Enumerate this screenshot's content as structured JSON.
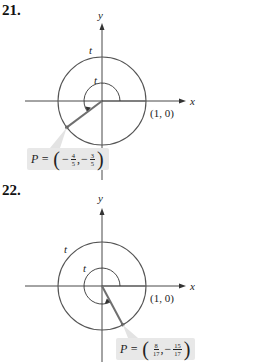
{
  "problems": [
    {
      "number": "21.",
      "axis_labels": {
        "x": "x",
        "y": "y"
      },
      "arc_label_outer": "t",
      "arc_label_inner": "t",
      "point_label": "(1, 0)",
      "P": {
        "prefix": "P =",
        "x": {
          "sign": "−",
          "num": "4",
          "den": "5"
        },
        "y": {
          "sign": "−",
          "num": "3",
          "den": "5"
        }
      }
    },
    {
      "number": "22.",
      "axis_labels": {
        "x": "x",
        "y": "y"
      },
      "arc_label_outer": "t",
      "arc_label_inner": "t",
      "point_label": "(1, 0)",
      "P": {
        "prefix": "P =",
        "x": {
          "sign": "",
          "num": "8",
          "den": "17"
        },
        "y": {
          "sign": "−",
          "num": "15",
          "den": "17"
        }
      }
    }
  ],
  "colors": {
    "circle": "#555555",
    "axis": "#333333",
    "radius": "#6f6f6f",
    "highlight": "#bdbdbd",
    "box": "#e8e8e8"
  }
}
